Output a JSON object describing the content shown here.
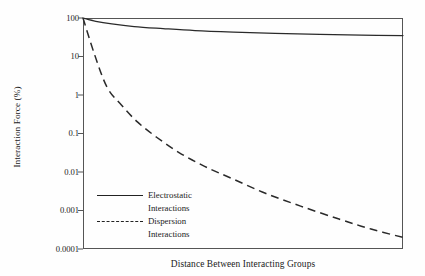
{
  "chart_data": {
    "type": "line",
    "title": "",
    "xlabel": "Distance Between Interacting Groups",
    "ylabel": "Interaction Force (%)",
    "yscale": "log",
    "ylim": [
      0.0001,
      100
    ],
    "ytick_labels": [
      "100",
      "10",
      "1",
      "0.1",
      "0.01",
      "0.001",
      "0.0001"
    ],
    "ytick_values": [
      100,
      10,
      1,
      0.1,
      0.01,
      0.001,
      0.0001
    ],
    "xlim": [
      0,
      1
    ],
    "xtick_labels": [],
    "grid": false,
    "legend_position": "lower-left-inside",
    "frame": "box",
    "line_color": "#222222",
    "background_color": "#ffffff",
    "series": [
      {
        "name": "Electrostatic Interactions",
        "style": "solid",
        "x": [
          0,
          0.04,
          0.09,
          0.16,
          0.25,
          0.35,
          0.47,
          0.6,
          0.74,
          0.87,
          1.0
        ],
        "y": [
          100,
          82,
          70,
          60,
          53,
          47,
          43,
          40,
          37.5,
          36,
          35
        ]
      },
      {
        "name": "Dispersion Interactions",
        "style": "dashed",
        "x": [
          0,
          0.035,
          0.075,
          0.12,
          0.17,
          0.23,
          0.3,
          0.38,
          0.47,
          0.57,
          0.68,
          0.8,
          0.9,
          1.0
        ],
        "y": [
          100,
          12,
          1.6,
          0.55,
          0.2,
          0.08,
          0.032,
          0.014,
          0.0065,
          0.0028,
          0.0013,
          0.0006,
          0.00033,
          0.0002
        ]
      }
    ]
  },
  "axes": {
    "y_label": "Interaction Force (%)",
    "x_label": "Distance Between Interacting Groups",
    "y_ticks": [
      {
        "label": "100"
      },
      {
        "label": "10"
      },
      {
        "label": "1"
      },
      {
        "label": "0.1"
      },
      {
        "label": "0.01"
      },
      {
        "label": "0.001"
      },
      {
        "label": "0.0001"
      }
    ]
  },
  "legend": {
    "entries": [
      {
        "style": "solid",
        "line1": "Electrostatic",
        "line2": "Interactions"
      },
      {
        "style": "dashed",
        "line1": "Dispersion",
        "line2": "Interactions"
      }
    ]
  }
}
